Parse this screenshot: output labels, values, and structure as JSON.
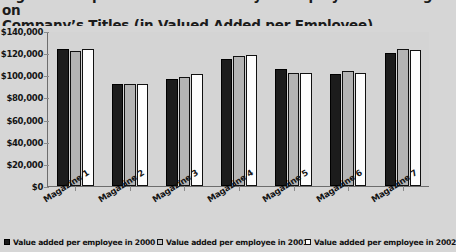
{
  "title": {
    "line1": "Figure: Comparison of Productivity of Employees Working on",
    "line2": "Company’s Titles (in Valued Added per Employee)"
  },
  "axes": {
    "y_tick_labels": [
      "$140,000",
      "$120,000",
      "$100,000",
      "$80,000",
      "$60,000",
      "$40,000",
      "$20,000",
      "$0"
    ],
    "x_tick_labels": [
      "Magazine 1",
      "Magazine 2",
      "Magazine 3",
      "Magazine 4",
      "Magazine 5",
      "Magazine 6",
      "Magazine 7"
    ]
  },
  "legend": {
    "items": [
      {
        "label": "Value added per employee in 2000",
        "color": "#1c1c1c"
      },
      {
        "label": "Value added per employee in 2001",
        "color": "#c2c2c2"
      },
      {
        "label": "Value added per employee in 2002",
        "color": "#fefefe"
      }
    ]
  },
  "chart_data": {
    "type": "bar",
    "title": "Figure: Comparison of Productivity of Employees Working on Company’s Titles (in Valued Added per Employee)",
    "xlabel": "",
    "ylabel": "",
    "ylim": [
      0,
      140000
    ],
    "ytick_step": 20000,
    "yticks": [
      0,
      20000,
      40000,
      60000,
      80000,
      100000,
      120000,
      140000
    ],
    "grid": false,
    "legend_position": "bottom",
    "categories": [
      "Magazine 1",
      "Magazine 2",
      "Magazine 3",
      "Magazine 4",
      "Magazine 5",
      "Magazine 6",
      "Magazine 7"
    ],
    "series": [
      {
        "name": "Value added per employee in 2000",
        "color": "#1c1c1c",
        "values": [
          124000,
          92000,
          97000,
          115000,
          106000,
          101000,
          120000
        ]
      },
      {
        "name": "Value added per employee in 2001",
        "color": "#c2c2c2",
        "values": [
          122000,
          92000,
          98000,
          117000,
          102000,
          104000,
          124000
        ]
      },
      {
        "name": "Value added per employee in 2002",
        "color": "#fefefe",
        "values": [
          124000,
          92000,
          101000,
          118000,
          102000,
          102000,
          123000
        ]
      }
    ]
  }
}
